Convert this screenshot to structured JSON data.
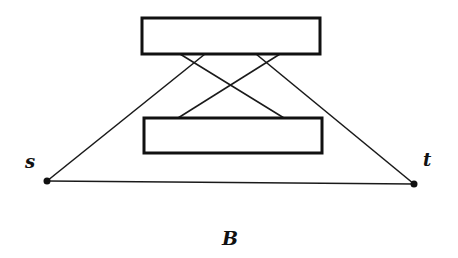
{
  "diagram": {
    "type": "graph",
    "boxes": [
      {
        "id": "top-box",
        "x": 142,
        "y": 18,
        "w": 178,
        "h": 36
      },
      {
        "id": "bottom-box",
        "x": 144,
        "y": 118,
        "w": 178,
        "h": 35
      }
    ],
    "nodes": [
      {
        "id": "s",
        "label": "s",
        "x": 47,
        "y": 181
      },
      {
        "id": "t",
        "label": "t",
        "x": 414,
        "y": 184
      }
    ],
    "edges": [
      {
        "from": "top-box",
        "to": "bottom-box",
        "x1": 180,
        "y1": 54,
        "x2": 284,
        "y2": 118
      },
      {
        "from": "top-box",
        "to": "bottom-box",
        "x1": 280,
        "y1": 54,
        "x2": 178,
        "y2": 118
      },
      {
        "from": "top-box",
        "to": "s",
        "x1": 205,
        "y1": 54,
        "x2": 47,
        "y2": 181
      },
      {
        "from": "top-box",
        "to": "t",
        "x1": 256,
        "y1": 54,
        "x2": 414,
        "y2": 184
      },
      {
        "from": "s",
        "to": "t",
        "x1": 47,
        "y1": 181,
        "x2": 414,
        "y2": 184
      }
    ],
    "caption": "B",
    "colors": {
      "stroke": "#111111",
      "background": "#ffffff"
    }
  }
}
